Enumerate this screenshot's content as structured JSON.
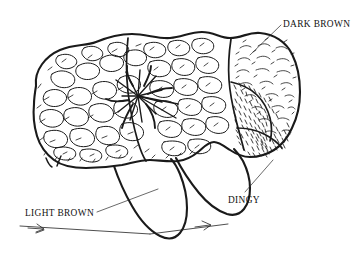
{
  "figure": {
    "background_color": "#ffffff",
    "ink_color": "#1a1a1a",
    "width": 356,
    "height": 260
  },
  "labels": {
    "dark_brown": "DARK BROWN",
    "light_brown": "LIGHT BROWN",
    "dingy": "DINGY"
  },
  "annotations": [
    {
      "id": "dark-brown",
      "text": "DARK BROWN",
      "text_x": 283,
      "text_y": 26,
      "anchor": "start",
      "points_to": "upper-right-lobe"
    },
    {
      "id": "light-brown",
      "text": "LIGHT BROWN",
      "text_x": 25,
      "text_y": 216,
      "anchor": "start",
      "points_to": "lower-left-flap"
    },
    {
      "id": "dingy",
      "text": "DINGY",
      "text_x": 228,
      "text_y": 203,
      "anchor": "start",
      "points_to": "lower-right-lobe"
    }
  ],
  "regions": [
    {
      "id": "left-lobe",
      "name": "left lobe",
      "texture": "coarse nodular cobblestone",
      "label": "LIGHT BROWN"
    },
    {
      "id": "center-scar",
      "name": "central radiating scar",
      "texture": "stellate radiating lines",
      "label": ""
    },
    {
      "id": "upper-right-lobe",
      "name": "upper right lobe",
      "texture": "sparse short hatching",
      "label": "DARK BROWN"
    },
    {
      "id": "lower-right-lobe",
      "name": "lower right lobe",
      "texture": "dense fine stipple hatching",
      "label": "DINGY"
    },
    {
      "id": "lower-flaps",
      "name": "two hanging lobes",
      "texture": "plain outline",
      "label": ""
    }
  ]
}
